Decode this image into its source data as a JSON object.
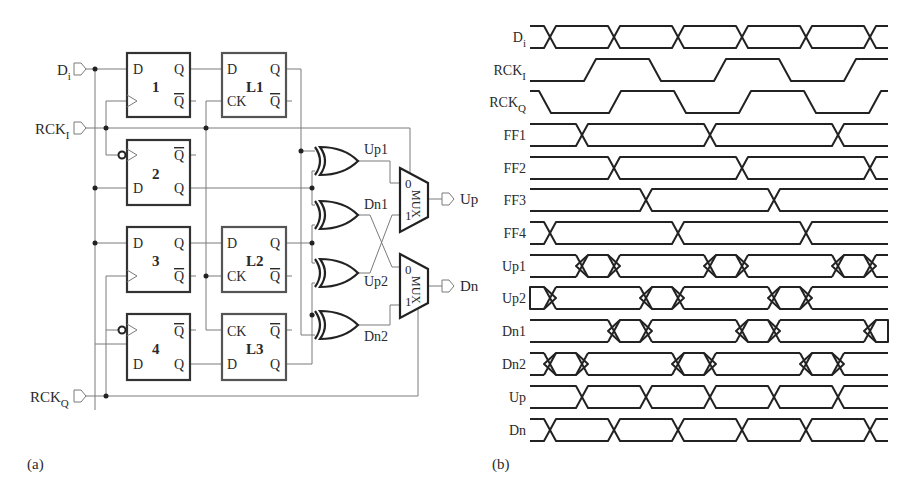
{
  "panels": {
    "a": {
      "caption": "(a)",
      "inputs": [
        {
          "name": "Di",
          "main": "D",
          "sub": "i"
        },
        {
          "name": "RCKI",
          "main": "RCK",
          "sub": "I"
        },
        {
          "name": "RCKQ",
          "main": "RCK",
          "sub": "Q"
        }
      ],
      "flipflops": [
        {
          "id": "1",
          "pins": [
            "D",
            "Q",
            "Q̄"
          ]
        },
        {
          "id": "2",
          "pins": [
            "D",
            "Q",
            "Q̄"
          ],
          "inverted_clock": true
        },
        {
          "id": "3",
          "pins": [
            "D",
            "Q",
            "Q̄"
          ]
        },
        {
          "id": "4",
          "pins": [
            "D",
            "Q",
            "Q̄"
          ],
          "inverted_clock": true
        }
      ],
      "latches": [
        {
          "id": "L1",
          "pins": [
            "D",
            "CK",
            "Q",
            "Q̄"
          ]
        },
        {
          "id": "L2",
          "pins": [
            "D",
            "CK",
            "Q",
            "Q̄"
          ]
        },
        {
          "id": "L3",
          "pins": [
            "CK",
            "D",
            "Q̄",
            "Q"
          ]
        }
      ],
      "pin_labels": {
        "d": "D",
        "q": "Q",
        "qbar": "Q",
        "ck": "CK"
      },
      "xor_outputs": [
        "Up1",
        "Dn1",
        "Up2",
        "Dn2"
      ],
      "mux": {
        "label": "MUX",
        "in0": "0",
        "in1": "1"
      },
      "outputs": [
        "Up",
        "Dn"
      ]
    },
    "b": {
      "caption": "(b)",
      "signals": [
        {
          "name": "Di",
          "main": "D",
          "sub": "i"
        },
        {
          "name": "RCKI",
          "main": "RCK",
          "sub": "I"
        },
        {
          "name": "RCKQ",
          "main": "RCK",
          "sub": "Q"
        },
        {
          "name": "FF1",
          "main": "FF1",
          "sub": ""
        },
        {
          "name": "FF2",
          "main": "FF2",
          "sub": ""
        },
        {
          "name": "FF3",
          "main": "FF3",
          "sub": ""
        },
        {
          "name": "FF4",
          "main": "FF4",
          "sub": ""
        },
        {
          "name": "Up1",
          "main": "Up1",
          "sub": ""
        },
        {
          "name": "Up2",
          "main": "Up2",
          "sub": ""
        },
        {
          "name": "Dn1",
          "main": "Dn1",
          "sub": ""
        },
        {
          "name": "Dn2",
          "main": "Dn2",
          "sub": ""
        },
        {
          "name": "Up",
          "main": "Up",
          "sub": ""
        },
        {
          "name": "Dn",
          "main": "Dn",
          "sub": ""
        }
      ]
    }
  },
  "timing": {
    "x_start": 530,
    "x_end": 888,
    "row_y": [
      37,
      70,
      102,
      135,
      168,
      200,
      233,
      266,
      298,
      331,
      364,
      397,
      430
    ],
    "half_height": 11,
    "rows": [
      {
        "type": "bus",
        "crossings": [
          550,
          614,
          678,
          742,
          806,
          870
        ]
      },
      {
        "type": "clock",
        "start": "low",
        "edges": [
          590,
          655,
          720,
          785,
          850
        ]
      },
      {
        "type": "clock",
        "start": "high",
        "edges": [
          545,
          615,
          680,
          745,
          810,
          875
        ]
      },
      {
        "type": "bus",
        "crossings": [
          582,
          710,
          838
        ]
      },
      {
        "type": "bus",
        "crossings": [
          614,
          742,
          870
        ]
      },
      {
        "type": "bus",
        "crossings": [
          646,
          774
        ]
      },
      {
        "type": "bus",
        "crossings": [
          550,
          678,
          806
        ]
      },
      {
        "type": "bus",
        "hatched": [
          [
            582,
            614
          ],
          [
            710,
            742
          ],
          [
            838,
            870
          ]
        ]
      },
      {
        "type": "bus",
        "hatched": [
          [
            518,
            550
          ],
          [
            646,
            678
          ],
          [
            774,
            806
          ]
        ]
      },
      {
        "type": "bus",
        "hatched": [
          [
            614,
            646
          ],
          [
            742,
            774
          ],
          [
            870,
            902
          ]
        ]
      },
      {
        "type": "bus",
        "hatched": [
          [
            550,
            582
          ],
          [
            678,
            710
          ],
          [
            806,
            838
          ]
        ]
      },
      {
        "type": "bus",
        "crossings": [
          582,
          646,
          710,
          774,
          838
        ]
      },
      {
        "type": "bus",
        "crossings": [
          550,
          614,
          678,
          742,
          806,
          870
        ]
      }
    ]
  }
}
